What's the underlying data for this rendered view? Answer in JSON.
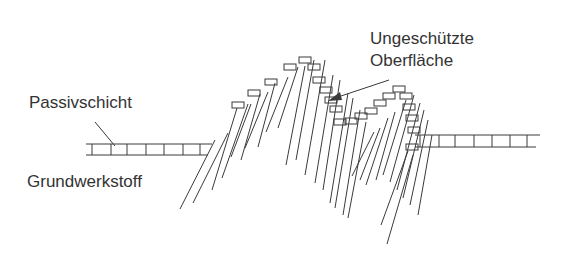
{
  "diagram": {
    "labels": {
      "passive_layer": "Passivschicht",
      "base_material": "Grundwerkstoff",
      "unprotected_surface_line1": "Ungeschützte",
      "unprotected_surface_line2": "Oberfläche"
    },
    "colors": {
      "line": "#3a3a3a",
      "text": "#333333",
      "background": "#ffffff"
    }
  }
}
